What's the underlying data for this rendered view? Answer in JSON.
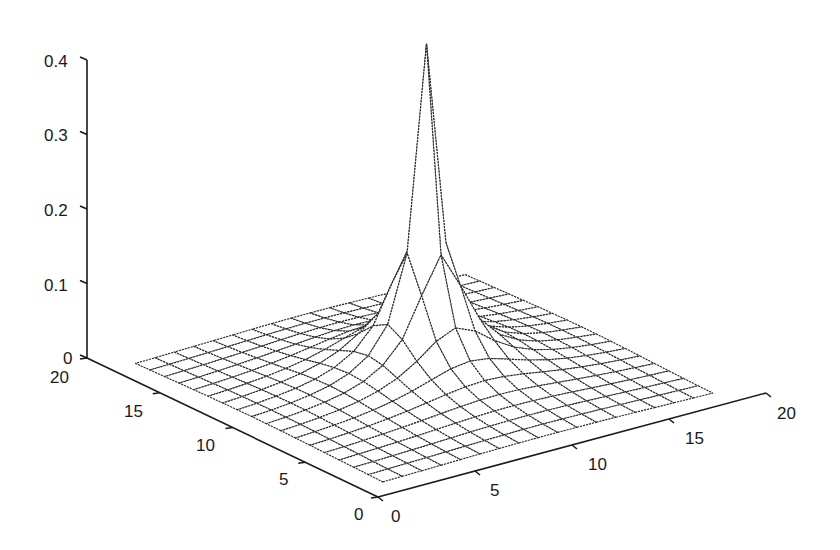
{
  "chart_data": {
    "type": "surface",
    "title": "",
    "xlabel": "",
    "ylabel": "",
    "zlabel": "",
    "x_ticks": [
      0,
      5,
      10,
      15,
      20
    ],
    "y_ticks": [
      0,
      5,
      10,
      15,
      20
    ],
    "z_ticks": [
      0,
      0.1,
      0.2,
      0.3,
      0.4
    ],
    "x_tick_labels": [
      "0",
      "5",
      "10",
      "15",
      "20"
    ],
    "y_tick_labels": [
      "0",
      "5",
      "10",
      "15",
      "20"
    ],
    "z_tick_labels": [
      "0",
      "0.1",
      "0.2",
      "0.3",
      "0.4"
    ],
    "xlim": [
      0,
      20
    ],
    "ylim": [
      0,
      20
    ],
    "zlim": [
      0,
      0.4
    ],
    "grid": false,
    "legend": null,
    "surface": {
      "style": "wireframe mesh with hidden lines removed",
      "grid_range": [
        1,
        18
      ],
      "peak_location": [
        10,
        10
      ],
      "peak_value": 0.445,
      "approx_values": {
        "peak": 0.445,
        "adjacent_neighbors": 0.21,
        "distance_2": 0.035,
        "far_field": 0.0
      }
    }
  },
  "projection": {
    "origin": [
      378,
      497
    ],
    "x_unit": [
      19.4,
      -5.2
    ],
    "y_unit": [
      -14.55,
      -6.95
    ],
    "z_per_unit": 745
  }
}
